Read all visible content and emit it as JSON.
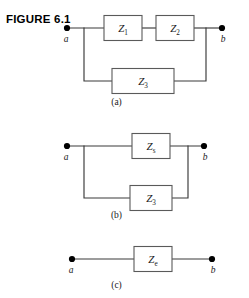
{
  "figure": {
    "title": "FIGURE 6.1"
  },
  "panels": [
    {
      "id": "a",
      "caption": "(a)",
      "terminals": {
        "left": "a",
        "right": "b"
      },
      "components": [
        {
          "name": "z1",
          "symbol": "Z",
          "subscript": "1"
        },
        {
          "name": "z2",
          "symbol": "Z",
          "subscript": "2"
        },
        {
          "name": "z3",
          "symbol": "Z",
          "subscript": "3"
        }
      ]
    },
    {
      "id": "b",
      "caption": "(b)",
      "terminals": {
        "left": "a",
        "right": "b"
      },
      "components": [
        {
          "name": "zs",
          "symbol": "Z",
          "subscript": "s"
        },
        {
          "name": "z3",
          "symbol": "Z",
          "subscript": "3"
        }
      ]
    },
    {
      "id": "c",
      "caption": "(c)",
      "terminals": {
        "left": "a",
        "right": "b"
      },
      "components": [
        {
          "name": "ze",
          "symbol": "Z",
          "subscript": "e"
        }
      ]
    }
  ],
  "colors": {
    "wire": "#3a3a3a",
    "box_stroke": "#5a5a5a",
    "node": "#000000",
    "text": "#1a1a1a",
    "background": "#ffffff"
  }
}
